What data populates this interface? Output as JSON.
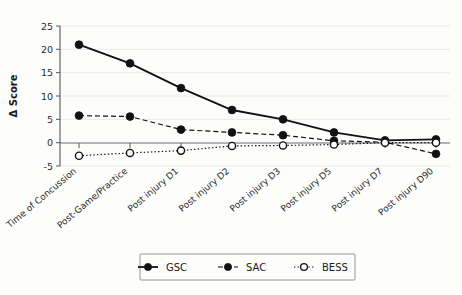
{
  "chart_data": {
    "type": "line",
    "title": "",
    "xlabel": "",
    "ylabel": "Δ Score",
    "ylim": [
      -5,
      25
    ],
    "yticks": [
      -5,
      0,
      5,
      10,
      15,
      20,
      25
    ],
    "ytick_labels": [
      "-5",
      "0",
      "5",
      "10",
      "15",
      "20",
      "25"
    ],
    "grid": true,
    "legend_position": "bottom",
    "categories": [
      "Time of Concussion",
      "Post-Game/Practice",
      "Post injury D1",
      "Post injury D2",
      "Post injury D3",
      "Post injury D5",
      "Post injury D7",
      "Post injury D90"
    ],
    "series": [
      {
        "name": "GSC",
        "values": [
          21.0,
          17.0,
          11.7,
          7.0,
          5.0,
          2.2,
          0.5,
          0.7
        ],
        "line_style": "solid",
        "marker": "filled-circle",
        "color": "#111111"
      },
      {
        "name": "SAC",
        "values": [
          5.8,
          5.6,
          2.8,
          2.2,
          1.6,
          0.4,
          0.1,
          -2.4
        ],
        "line_style": "dashed",
        "marker": "filled-circle",
        "color": "#111111"
      },
      {
        "name": "BESS",
        "values": [
          -2.8,
          -2.2,
          -1.7,
          -0.7,
          -0.6,
          -0.4,
          0.0,
          0.0
        ],
        "line_style": "dotted",
        "marker": "open-circle",
        "color": "#111111"
      }
    ]
  },
  "axis": {
    "y_title": "Δ Score"
  },
  "legend": {
    "entries": [
      {
        "label": "GSC"
      },
      {
        "label": "SAC"
      },
      {
        "label": "BESS"
      }
    ]
  }
}
